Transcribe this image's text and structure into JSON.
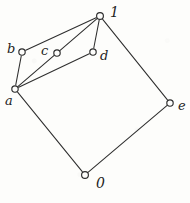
{
  "figure": {
    "type": "hasse-diagram",
    "caption": "",
    "width": 190,
    "height": 203,
    "background_color": "#fdfdfb",
    "ink_color": "#2b2b2b"
  },
  "chart_data": {
    "type": "diagram",
    "subtype": "hasse-diagram",
    "title": "",
    "xlabel": "",
    "ylabel": "",
    "grid": false,
    "legend": null,
    "nodes": [
      {
        "id": "1",
        "label": "1",
        "x": 100,
        "y": 16,
        "label_x": 110,
        "label_y": 5,
        "label_class": "label-bound",
        "radius": 3.4
      },
      {
        "id": "b",
        "label": "b",
        "x": 22,
        "y": 52,
        "label_x": 7,
        "label_y": 42,
        "label_class": "label-letter",
        "radius": 3.2
      },
      {
        "id": "c",
        "label": "c",
        "x": 57,
        "y": 53,
        "label_x": 41,
        "label_y": 44,
        "label_class": "label-letter",
        "radius": 3.2
      },
      {
        "id": "d",
        "label": "d",
        "x": 93,
        "y": 52,
        "label_x": 100,
        "label_y": 49,
        "label_class": "label-letter",
        "radius": 3.2
      },
      {
        "id": "a",
        "label": "a",
        "x": 15,
        "y": 89,
        "label_x": 5,
        "label_y": 94,
        "label_class": "label-letter",
        "radius": 3.2
      },
      {
        "id": "e",
        "label": "e",
        "x": 170,
        "y": 103,
        "label_x": 178,
        "label_y": 99,
        "label_class": "label-letter",
        "radius": 3.2
      },
      {
        "id": "0",
        "label": "0",
        "x": 85,
        "y": 175,
        "label_x": 96,
        "label_y": 176,
        "label_class": "label-bound",
        "radius": 3.4
      }
    ],
    "edges": [
      {
        "from": "1",
        "to": "b"
      },
      {
        "from": "1",
        "to": "c"
      },
      {
        "from": "1",
        "to": "d"
      },
      {
        "from": "1",
        "to": "e"
      },
      {
        "from": "a",
        "to": "b"
      },
      {
        "from": "a",
        "to": "c"
      },
      {
        "from": "a",
        "to": "d"
      },
      {
        "from": "a",
        "to": "0"
      },
      {
        "from": "0",
        "to": "e"
      }
    ]
  }
}
